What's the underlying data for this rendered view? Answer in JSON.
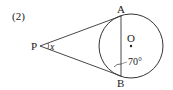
{
  "problem": {
    "number": "(2)"
  },
  "diagram": {
    "points": {
      "P": {
        "label": "P",
        "x": 40,
        "y": 46
      },
      "A": {
        "label": "A",
        "x": 121,
        "y": 18
      },
      "B": {
        "label": "B",
        "x": 121,
        "y": 73
      },
      "O": {
        "label": "O",
        "x": 131,
        "y": 46
      }
    },
    "circle": {
      "cx": 131,
      "cy": 46,
      "r": 32
    },
    "angle_x_label": "x",
    "angle_label": "70°",
    "stroke_color": "#333333"
  }
}
